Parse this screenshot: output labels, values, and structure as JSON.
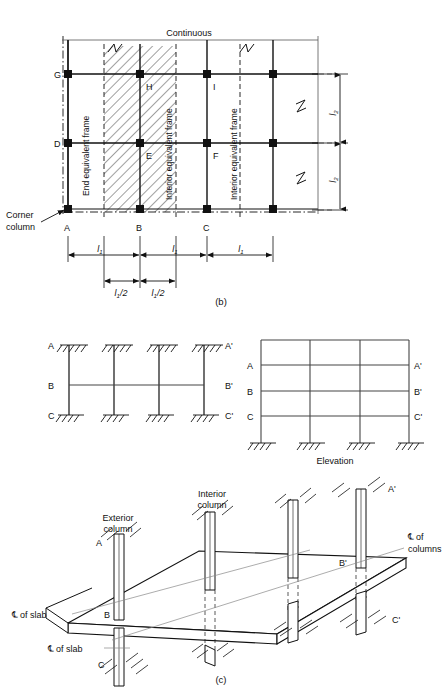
{
  "figure": {
    "captions": {
      "b": "(b)",
      "c": "(c)"
    },
    "elevation_label": "Elevation"
  },
  "plan": {
    "title_note": "Continuous",
    "corner_callout": "Corner\ncolumn",
    "corner_callout_line1": "Corner",
    "corner_callout_line2": "column",
    "frame_bands": [
      {
        "id": "end-frame",
        "label": "End equivalent frame"
      },
      {
        "id": "interior-frame-1",
        "label": "Interior equivalent frame"
      },
      {
        "id": "interior-frame-2",
        "label": "Interior equivalent frame"
      }
    ],
    "nodes": [
      {
        "id": "G",
        "label": "G",
        "row": "top",
        "col": 1
      },
      {
        "id": "H",
        "label": "H",
        "row": "top",
        "col": 2
      },
      {
        "id": "I",
        "label": "I",
        "row": "top",
        "col": 3
      },
      {
        "id": "D",
        "label": "D",
        "row": "middle",
        "col": 1
      },
      {
        "id": "E",
        "label": "E",
        "row": "middle",
        "col": 2
      },
      {
        "id": "F",
        "label": "F",
        "row": "middle",
        "col": 3
      },
      {
        "id": "A",
        "label": "A",
        "row": "bottom",
        "col": 1
      },
      {
        "id": "B",
        "label": "B",
        "row": "bottom",
        "col": 2
      },
      {
        "id": "C",
        "label": "C",
        "row": "bottom",
        "col": 3
      }
    ],
    "horizontal_dimensions": [
      {
        "id": "span-1",
        "base": "l",
        "subscript": "1",
        "text": "l1"
      },
      {
        "id": "span-2",
        "base": "l",
        "subscript": "1",
        "text": "l1"
      },
      {
        "id": "span-3",
        "base": "l",
        "subscript": "1",
        "text": "l1"
      }
    ],
    "half_span_dimensions": [
      {
        "id": "half-span-left",
        "base": "l",
        "subscript": "1",
        "suffix": "/2"
      },
      {
        "id": "half-span-right",
        "base": "l",
        "subscript": "1",
        "suffix": "/2"
      }
    ],
    "vertical_dimensions": [
      {
        "id": "bay-height-upper",
        "base": "l",
        "subscript": "2"
      },
      {
        "id": "bay-height-lower",
        "base": "l",
        "subscript": "2"
      }
    ]
  },
  "frames": {
    "isolated_frame": {
      "levels": [
        {
          "id": "level-A",
          "left": "A",
          "right": "A'"
        },
        {
          "id": "level-B",
          "left": "B",
          "right": "B'"
        },
        {
          "id": "level-C",
          "left": "C",
          "right": "C'"
        }
      ],
      "column_count": 4
    },
    "elevation": {
      "title": "Elevation",
      "levels": [
        {
          "id": "elev-level-A",
          "left": "A",
          "right": "A'"
        },
        {
          "id": "elev-level-B",
          "left": "B",
          "right": "B'"
        },
        {
          "id": "elev-level-C",
          "left": "C",
          "right": "C'"
        }
      ],
      "column_count": 4
    }
  },
  "isometric": {
    "labels": {
      "exterior_column_line1": "Exterior",
      "exterior_column_line2": "column",
      "interior_column_line1": "Interior",
      "interior_column_line2": "column",
      "cl_of_columns_line1": "of",
      "cl_of_columns_line2": "columns",
      "cl_of_slab_upper": "of slab",
      "cl_of_slab_lower": "of slab",
      "centerline_symbol": "℄"
    },
    "nodes": [
      {
        "id": "iso-A",
        "label": "A"
      },
      {
        "id": "iso-B",
        "label": "B"
      },
      {
        "id": "iso-C",
        "label": "C"
      },
      {
        "id": "iso-Ap",
        "label": "A'"
      },
      {
        "id": "iso-Bp",
        "label": "B'"
      },
      {
        "id": "iso-Cp",
        "label": "C'"
      }
    ]
  },
  "colors": {
    "line": "#111111",
    "thin": "#555555",
    "background": "#ffffff"
  }
}
